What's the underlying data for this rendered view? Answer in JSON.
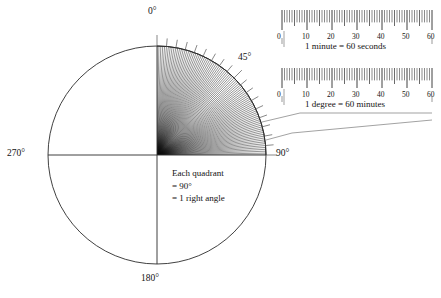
{
  "figure": {
    "type": "angle-circle-diagram"
  },
  "circle": {
    "center_x": 157,
    "center_y": 155,
    "radius": 109,
    "stroke_color": "#2b2b2b",
    "labels": [
      {
        "name": "top",
        "text": "0°",
        "value": 0,
        "x": 148,
        "y": 8
      },
      {
        "name": "right",
        "text": "90°",
        "value": 90,
        "x": 276,
        "y": 149
      },
      {
        "name": "bottom",
        "text": "180°",
        "value": 180,
        "x": 143,
        "y": 274
      },
      {
        "name": "left",
        "text": "270°",
        "value": 270,
        "x": 8,
        "y": 149
      },
      {
        "name": "diagonal",
        "text": "45°",
        "value": 45,
        "x": 238,
        "y": 53
      }
    ]
  },
  "quadrant": {
    "description": "Shaded first quadrant subdivided into 90 one-degree sectors",
    "start_angle": 0,
    "end_angle": 90,
    "divisions": 90,
    "tick_interval": 5,
    "shade_color": "#111111"
  },
  "note": {
    "name": "quadrant-note",
    "lines": [
      "Each quadrant",
      "= 90°",
      "= 1 right angle"
    ],
    "x": 172,
    "y": 168
  },
  "rulers": [
    {
      "name": "minute-ruler",
      "caption": "1 minute = 60 seconds",
      "unit": "seconds",
      "ticks_total": 60,
      "major_interval": 10,
      "tick_labels": [
        "0",
        "10",
        "20",
        "30",
        "40",
        "50",
        "60"
      ],
      "tick_values": [
        0,
        10,
        20,
        30,
        40,
        50,
        60
      ],
      "x": 282,
      "y": 10,
      "width": 150,
      "height": 20
    },
    {
      "name": "degree-ruler",
      "caption": "1 degree = 60 minutes",
      "unit": "minutes",
      "ticks_total": 60,
      "major_interval": 10,
      "tick_labels": [
        "0",
        "10",
        "20",
        "30",
        "40",
        "50",
        "60"
      ],
      "tick_values": [
        0,
        10,
        20,
        30,
        40,
        50,
        60
      ],
      "x": 282,
      "y": 68,
      "width": 150,
      "height": 20
    }
  ],
  "colors": {
    "line": "#2b2b2b",
    "leader": "#6e6e6e",
    "text": "#121212",
    "background": "#ffffff"
  }
}
